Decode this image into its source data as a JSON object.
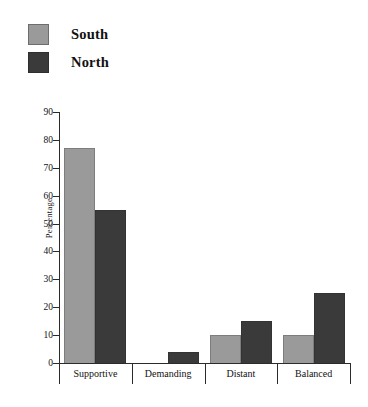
{
  "legend": {
    "position": "top-left",
    "entries": [
      {
        "label": "South",
        "color": "#9a9a9a",
        "swatch_name": "legend-swatch-south"
      },
      {
        "label": "North",
        "color": "#3a3a3a",
        "swatch_name": "legend-swatch-north"
      }
    ]
  },
  "axes": {
    "ylabel": "Percentage",
    "yticks": [
      "0",
      "10",
      "20",
      "30",
      "40",
      "50",
      "60",
      "70",
      "80",
      "90"
    ]
  },
  "chart_data": {
    "type": "bar",
    "title": "",
    "subtitle": "",
    "xlabel": "",
    "ylabel": "Percentage",
    "categories": [
      "Supportive",
      "Demanding",
      "Distant",
      "Balanced"
    ],
    "series": [
      {
        "name": "South",
        "color": "#9a9a9a",
        "values": [
          77,
          0,
          10,
          10
        ]
      },
      {
        "name": "North",
        "color": "#3a3a3a",
        "values": [
          55,
          4,
          15,
          25
        ]
      }
    ],
    "ylim": [
      0,
      90
    ],
    "ytick_step": 10,
    "grid": false,
    "legend_position": "top-left",
    "annotations": []
  }
}
